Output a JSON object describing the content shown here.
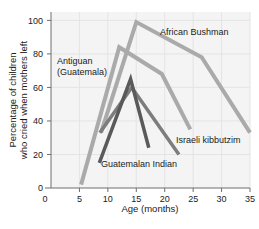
{
  "chart_data": {
    "type": "line",
    "title": "",
    "xlabel": "Age (months)",
    "ylabel": "Percentage of children who cried when mothers left",
    "ylabel_line1": "Percentage of children",
    "ylabel_line2": "who cried when mothers left",
    "xlim": [
      0,
      35
    ],
    "ylim": [
      0,
      105
    ],
    "xticks": [
      0,
      5,
      10,
      15,
      20,
      25,
      30,
      35
    ],
    "yticks": [
      0,
      20,
      40,
      60,
      80,
      100
    ],
    "xtick_labels": [
      "0",
      "5",
      "10",
      "15",
      "20",
      "25",
      "30",
      "35"
    ],
    "ytick_labels": [
      "0",
      "20",
      "40",
      "60",
      "80",
      "100"
    ],
    "grid": true,
    "legend": "inline-annotations",
    "series": [
      {
        "name": "Antiguan (Guatemala)",
        "label_line1": "Antiguan",
        "label_line2": "(Guatemala)",
        "color": "#aaaaaa",
        "width": 4,
        "points": [
          [
            5.3,
            2
          ],
          [
            12.0,
            84
          ],
          [
            19.5,
            68
          ],
          [
            24.5,
            35
          ]
        ]
      },
      {
        "name": "African Bushman",
        "label_line1": "African Bushman",
        "label_line2": "",
        "color": "#aaaaaa",
        "width": 4,
        "points": [
          [
            8.8,
            33
          ],
          [
            15.0,
            99
          ],
          [
            26.5,
            78
          ],
          [
            35.0,
            33
          ]
        ]
      },
      {
        "name": "Israeli kibbutzim",
        "label_line1": "Israeli kibbutzim",
        "label_line2": "",
        "color": "#7d7d7d",
        "width": 3.5,
        "points": [
          [
            8.6,
            33
          ],
          [
            14.2,
            60
          ],
          [
            22.5,
            20
          ]
        ]
      },
      {
        "name": "Guatemalan Indian",
        "label_line1": "Guatemalan Indian",
        "label_line2": "",
        "color": "#5a5a5a",
        "width": 3.5,
        "points": [
          [
            8.5,
            15
          ],
          [
            14.0,
            65
          ],
          [
            17.2,
            24
          ]
        ]
      }
    ],
    "annotations": [
      {
        "key": "antiguan",
        "text_line1": "Antiguan",
        "text_line2": "(Guatemala)",
        "x": 57,
        "y": 64
      },
      {
        "key": "bushman",
        "text_line1": "African Bushman",
        "text_line2": "",
        "x": 160,
        "y": 35
      },
      {
        "key": "kibbutzim",
        "text_line1": "Israeli kibbutzim",
        "text_line2": "",
        "x": 176,
        "y": 143
      },
      {
        "key": "guatemalan",
        "text_line1": "Guatemalan Indian",
        "text_line2": "",
        "x": 101,
        "y": 167
      }
    ]
  }
}
